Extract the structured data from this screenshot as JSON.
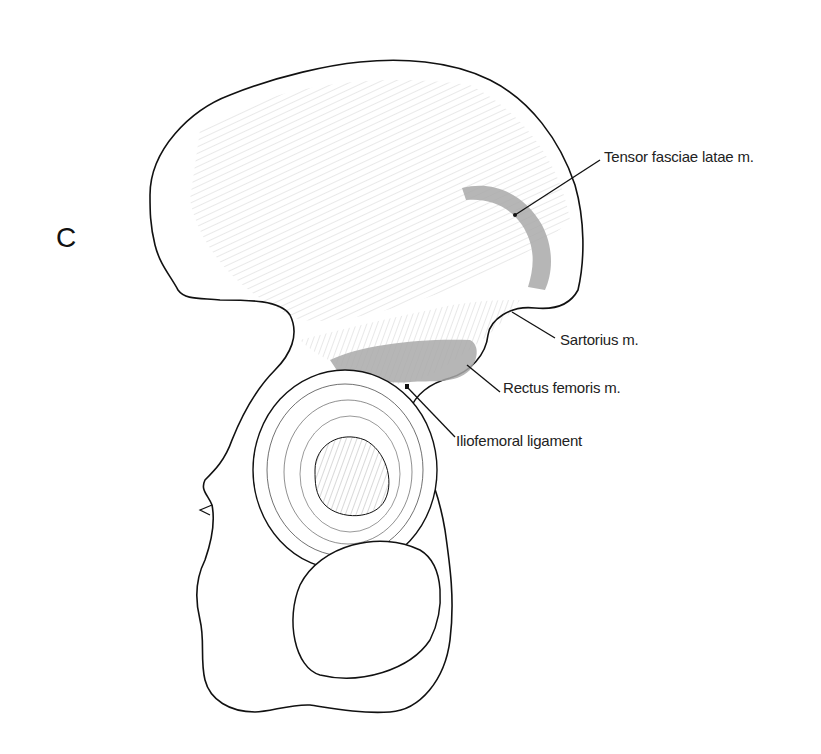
{
  "figure": {
    "panel_letter": "C",
    "colors": {
      "outline": "#111111",
      "hatching": "#555555",
      "muscle_attachment": "#a9a9a9",
      "background": "#ffffff"
    },
    "labels": [
      {
        "id": "tensor",
        "text": "Tensor fasciae latae m.",
        "x": 604,
        "y": 157
      },
      {
        "id": "sartorius",
        "text": "Sartorius m.",
        "x": 560,
        "y": 340
      },
      {
        "id": "rectus",
        "text": "Rectus femoris m.",
        "x": 503,
        "y": 388
      },
      {
        "id": "iliofemoral",
        "text": "Iliofemoral ligament",
        "x": 456,
        "y": 441
      }
    ]
  }
}
